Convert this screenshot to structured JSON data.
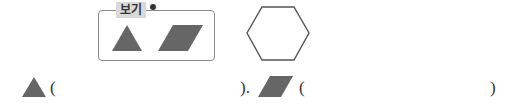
{
  "example": {
    "label": "보기",
    "shapes": [
      "triangle-icon",
      "parallelogram-icon"
    ]
  },
  "target_shape": "hexagon-icon",
  "answer_row": {
    "item1": {
      "shape": "triangle-icon",
      "open": "(",
      "value": "",
      "close": ")."
    },
    "item2": {
      "shape": "parallelogram-icon",
      "open": "(",
      "value": "",
      "close": ")"
    }
  },
  "colors": {
    "shape_fill": "#666666",
    "outline": "#555555",
    "label_bg": "#d9d9d9"
  }
}
